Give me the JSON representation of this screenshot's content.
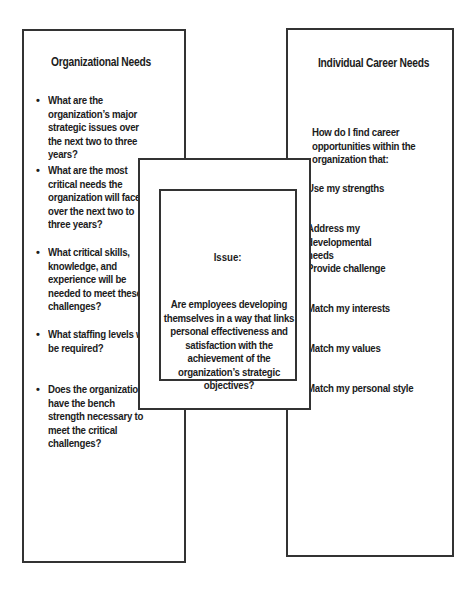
{
  "left_panel": {
    "title": "Organizational Needs",
    "items": [
      {
        "text": "What are the organization’s major strategic issues over the next two to three years?"
      },
      {
        "text": "What are the most critical needs the organization will face over the next two to three years?"
      },
      {
        "text": "What critical skills, knowledge, and experience will be needed to meet these challenges?"
      },
      {
        "text": "What staffing levels will be required?"
      },
      {
        "text": "Does the organization have the bench strength necessary to meet the critical challenges?"
      }
    ]
  },
  "right_panel": {
    "title": "Individual Career Needs",
    "intro": "How do I find career opportunities within the organization that:",
    "items": [
      {
        "text": "Use my strengths"
      },
      {
        "text": "Address my developmental needs"
      },
      {
        "text": "Provide challenge"
      },
      {
        "text": "Match my interests"
      },
      {
        "text": "Match my values"
      },
      {
        "text": "Match my personal style"
      }
    ]
  },
  "center_panel": {
    "label": "Issue:",
    "question": "Are employees developing themselves in a way that links personal effectiveness and satisfaction with the achievement of the organization’s strategic objectives?"
  },
  "bullet_glyph": "•"
}
